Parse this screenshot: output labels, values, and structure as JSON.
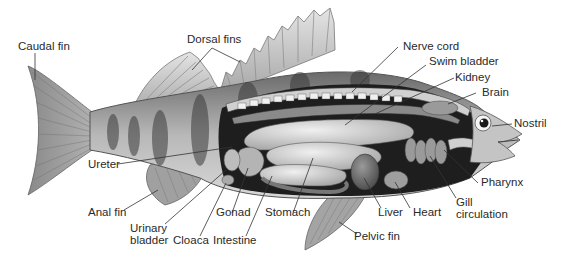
{
  "diagram": {
    "labels": {
      "caudal_fin": "Caudal fin",
      "dorsal_fins": "Dorsal fins",
      "nerve_cord": "Nerve cord",
      "swim_bladder": "Swim bladder",
      "kidney": "Kidney",
      "brain": "Brain",
      "nostril": "Nostril",
      "ureter": "Ureter",
      "anal_fin": "Anal fin",
      "urinary_bladder_1": "Urinary",
      "urinary_bladder_2": "bladder",
      "cloaca": "Cloaca",
      "gonad": "Gonad",
      "intestine": "Intestine",
      "stomach": "Stomach",
      "liver": "Liver",
      "heart": "Heart",
      "gill_circulation_1": "Gill",
      "gill_circulation_2": "circulation",
      "pharynx": "Pharynx",
      "pelvic_fin": "Pelvic fin"
    }
  }
}
